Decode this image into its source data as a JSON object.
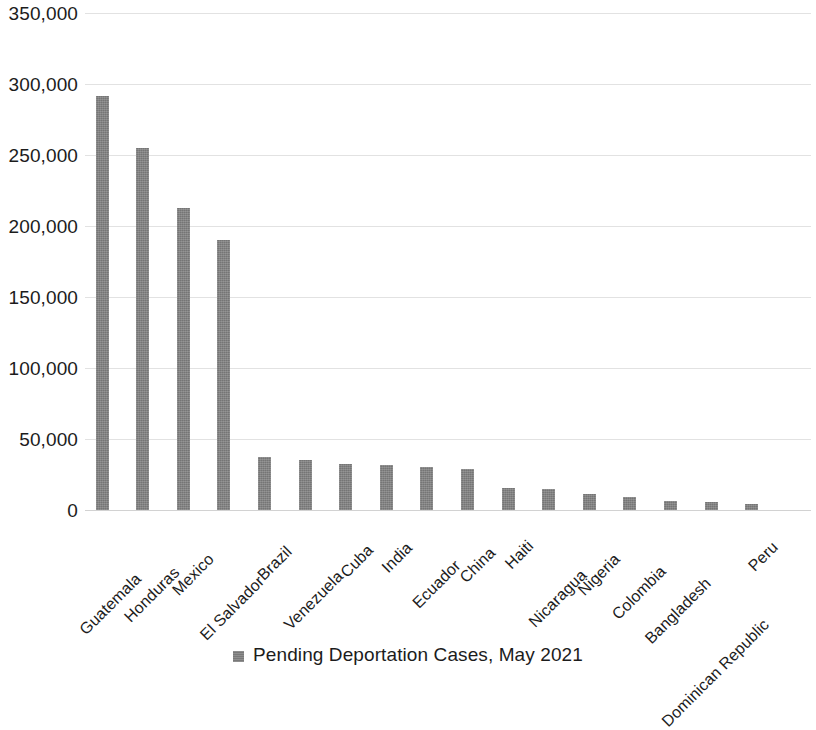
{
  "chart_data": {
    "type": "bar",
    "title": "",
    "xlabel": "",
    "ylabel": "",
    "ylim": [
      0,
      350000
    ],
    "ytick_values": [
      0,
      50000,
      100000,
      150000,
      200000,
      250000,
      300000,
      350000
    ],
    "ytick_labels": [
      "0",
      "50,000",
      "100,000",
      "150,000",
      "200,000",
      "250,000",
      "300,000",
      "350,000"
    ],
    "grid": true,
    "legend_position": "bottom",
    "bar_color": "#7f7f7f",
    "categories": [
      "Guatemala",
      "Honduras",
      "Mexico",
      "El Salvador",
      "Brazil",
      "Venezuela",
      "Cuba",
      "India",
      "Ecuador",
      "China",
      "Haiti",
      "Nicaragua",
      "Nigeria",
      "Colombia",
      "Bangladesh",
      "Dominican Republic",
      "Peru"
    ],
    "series": [
      {
        "name": "Pending Deportation Cases, May 2021",
        "values": [
          291500,
          255000,
          213000,
          190000,
          37500,
          35500,
          32500,
          32000,
          30500,
          29000,
          15500,
          15000,
          11000,
          9000,
          6500,
          5500,
          4500
        ]
      }
    ]
  },
  "legend": {
    "swatch_icon": "legend-square-icon",
    "label": "Pending Deportation Cases, May 2021"
  }
}
